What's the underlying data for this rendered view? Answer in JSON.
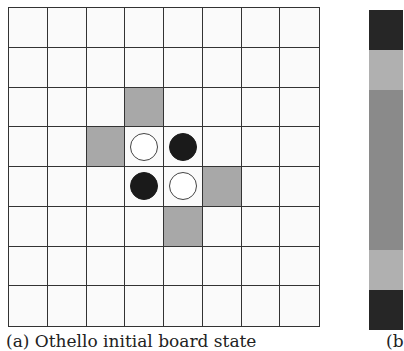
{
  "board": {
    "size": 8,
    "hint_cells": [
      [
        2,
        3
      ],
      [
        3,
        2
      ],
      [
        4,
        5
      ],
      [
        5,
        4
      ]
    ],
    "pieces": [
      {
        "row": 3,
        "col": 3,
        "color": "white"
      },
      {
        "row": 3,
        "col": 4,
        "color": "black"
      },
      {
        "row": 4,
        "col": 3,
        "color": "black"
      },
      {
        "row": 4,
        "col": 4,
        "color": "white"
      }
    ],
    "hint_color": "#a8a8a8"
  },
  "strip": {
    "bands": [
      {
        "color": "#262626",
        "height": 40
      },
      {
        "color": "#b0b0b0",
        "height": 40
      },
      {
        "color": "#8a8a8a",
        "height": 160
      },
      {
        "color": "#b0b0b0",
        "height": 40
      },
      {
        "color": "#262626",
        "height": 40
      }
    ]
  },
  "captions": {
    "a": "(a) Othello initial board state",
    "b": "(b"
  }
}
